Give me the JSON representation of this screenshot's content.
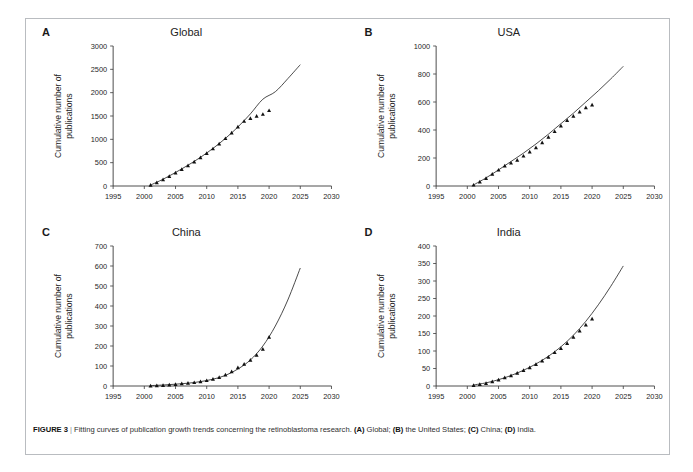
{
  "figure": {
    "label": "FIGURE 3",
    "separator": "|",
    "caption_main": "Fitting curves of publication growth trends concerning the retinoblastoma research.",
    "caption_parts": [
      {
        "ref": "(A)",
        "text": "Global;"
      },
      {
        "ref": "(B)",
        "text": "the United States;"
      },
      {
        "ref": "(C)",
        "text": "China;"
      },
      {
        "ref": "(D)",
        "text": "India."
      }
    ],
    "colors": {
      "frame": "#b9bcc0",
      "axis": "#3a3a3a",
      "curve": "#2b2b2b",
      "marker": "#111111",
      "background": "#ffffff"
    }
  },
  "chart_data": [
    {
      "panel": "A",
      "type": "scatter",
      "title": "Global",
      "xlabel": "",
      "ylabel": "Cumulative number of publications",
      "ylabel_lines": [
        "Cumulative number of",
        "publications"
      ],
      "xlim": [
        1995,
        2030
      ],
      "ylim": [
        0,
        3000
      ],
      "xticks": [
        1995,
        2000,
        2005,
        2010,
        2015,
        2020,
        2025,
        2030
      ],
      "yticks": [
        0,
        500,
        1000,
        1500,
        2000,
        2500,
        3000
      ],
      "grid": false,
      "legend": "none",
      "series": [
        {
          "name": "Observed cumulative publications",
          "marker": "triangle",
          "x": [
            2001,
            2002,
            2003,
            2004,
            2005,
            2006,
            2007,
            2008,
            2009,
            2010,
            2011,
            2012,
            2013,
            2014,
            2015,
            2016,
            2017,
            2018,
            2019,
            2020
          ],
          "values": [
            20,
            75,
            140,
            210,
            285,
            360,
            440,
            520,
            610,
            700,
            800,
            905,
            1020,
            1140,
            1270,
            1390,
            1450,
            1500,
            1540,
            1620
          ]
        },
        {
          "name": "Fitted growth curve",
          "marker": "none",
          "x": [
            2001,
            2003,
            2005,
            2007,
            2009,
            2011,
            2013,
            2015,
            2017,
            2019,
            2021,
            2023,
            2025
          ],
          "values": [
            20,
            145,
            290,
            445,
            615,
            805,
            1020,
            1265,
            1545,
            1860,
            2020,
            2300,
            2600
          ]
        }
      ]
    },
    {
      "panel": "B",
      "type": "scatter",
      "title": "USA",
      "xlabel": "",
      "ylabel": "Cumulative number of publications",
      "ylabel_lines": [
        "Cumulative number of",
        "publications"
      ],
      "xlim": [
        1995,
        2030
      ],
      "ylim": [
        0,
        1000
      ],
      "xticks": [
        1995,
        2000,
        2005,
        2010,
        2015,
        2020,
        2025,
        2030
      ],
      "yticks": [
        0,
        200,
        400,
        600,
        800,
        1000
      ],
      "grid": false,
      "legend": "none",
      "series": [
        {
          "name": "Observed cumulative publications",
          "marker": "triangle",
          "x": [
            2001,
            2002,
            2003,
            2004,
            2005,
            2006,
            2007,
            2008,
            2009,
            2010,
            2011,
            2012,
            2013,
            2014,
            2015,
            2016,
            2017,
            2018,
            2019,
            2020
          ],
          "values": [
            8,
            30,
            55,
            85,
            115,
            145,
            165,
            185,
            215,
            245,
            275,
            310,
            350,
            390,
            430,
            470,
            500,
            530,
            560,
            580
          ]
        },
        {
          "name": "Fitted growth curve",
          "marker": "none",
          "x": [
            2001,
            2003,
            2005,
            2007,
            2009,
            2011,
            2013,
            2015,
            2017,
            2019,
            2021,
            2023,
            2025
          ],
          "values": [
            8,
            58,
            115,
            175,
            235,
            300,
            370,
            445,
            520,
            600,
            680,
            765,
            855
          ]
        }
      ]
    },
    {
      "panel": "C",
      "type": "scatter",
      "title": "China",
      "xlabel": "",
      "ylabel": "Cumulative number of publications",
      "ylabel_lines": [
        "Cumulative number of",
        "publications"
      ],
      "xlim": [
        1995,
        2030
      ],
      "ylim": [
        0,
        700
      ],
      "xticks": [
        1995,
        2000,
        2005,
        2010,
        2015,
        2020,
        2025,
        2030
      ],
      "yticks": [
        0,
        100,
        200,
        300,
        400,
        500,
        600,
        700
      ],
      "grid": false,
      "legend": "none",
      "series": [
        {
          "name": "Observed cumulative publications",
          "marker": "triangle",
          "x": [
            2001,
            2002,
            2003,
            2004,
            2005,
            2006,
            2007,
            2008,
            2009,
            2010,
            2011,
            2012,
            2013,
            2014,
            2015,
            2016,
            2017,
            2018,
            2019,
            2020
          ],
          "values": [
            1,
            2,
            4,
            6,
            9,
            12,
            15,
            18,
            22,
            28,
            35,
            44,
            56,
            72,
            92,
            110,
            130,
            155,
            185,
            245
          ]
        },
        {
          "name": "Fitted growth curve",
          "marker": "none",
          "x": [
            2001,
            2003,
            2005,
            2007,
            2009,
            2011,
            2013,
            2015,
            2017,
            2019,
            2021,
            2023,
            2025
          ],
          "values": [
            2,
            5,
            9,
            14,
            22,
            34,
            53,
            85,
            130,
            200,
            300,
            430,
            590
          ]
        }
      ]
    },
    {
      "panel": "D",
      "type": "scatter",
      "title": "India",
      "xlabel": "",
      "ylabel": "Cumulative number of publications",
      "ylabel_lines": [
        "Cumulative number of",
        "publications"
      ],
      "xlim": [
        1995,
        2030
      ],
      "ylim": [
        0,
        400
      ],
      "xticks": [
        1995,
        2000,
        2005,
        2010,
        2015,
        2020,
        2025,
        2030
      ],
      "yticks": [
        0,
        50,
        100,
        150,
        200,
        250,
        300,
        350,
        400
      ],
      "grid": false,
      "legend": "none",
      "series": [
        {
          "name": "Observed cumulative publications",
          "marker": "triangle",
          "x": [
            2001,
            2002,
            2003,
            2004,
            2005,
            2006,
            2007,
            2008,
            2009,
            2010,
            2011,
            2012,
            2013,
            2014,
            2015,
            2016,
            2017,
            2018,
            2019,
            2020
          ],
          "values": [
            2,
            5,
            8,
            13,
            18,
            24,
            30,
            37,
            45,
            53,
            62,
            72,
            83,
            96,
            108,
            122,
            140,
            158,
            175,
            192
          ]
        },
        {
          "name": "Fitted growth curve",
          "marker": "none",
          "x": [
            2001,
            2003,
            2005,
            2007,
            2009,
            2011,
            2013,
            2015,
            2017,
            2019,
            2021,
            2023,
            2025
          ],
          "values": [
            3,
            9,
            18,
            30,
            45,
            63,
            85,
            112,
            145,
            185,
            232,
            285,
            343
          ]
        }
      ]
    }
  ]
}
